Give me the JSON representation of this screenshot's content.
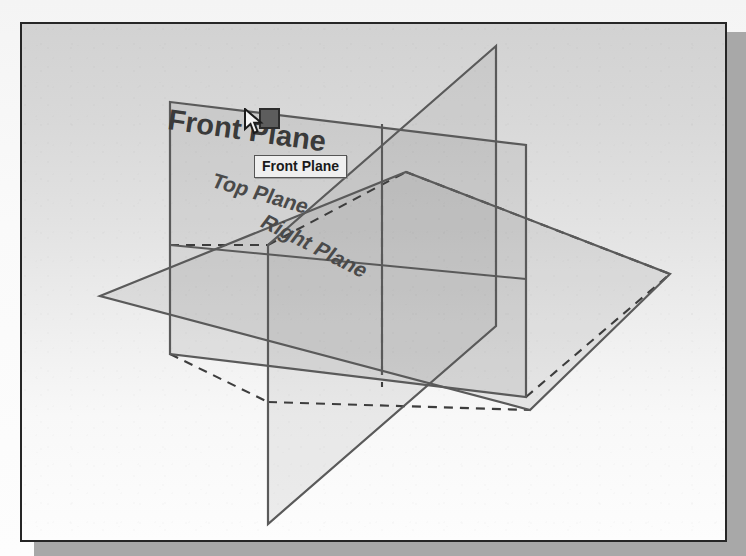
{
  "viewport": {
    "name": "cad-graphics-area",
    "background_top_color": "#d2d2d2",
    "background_bottom_color": "#fdfdfd",
    "border_color": "#262626",
    "shadow_color": "#a8a8a8"
  },
  "labels": {
    "front_plane": "Front Plane",
    "top_plane": "Top Plane",
    "right_plane": "Right Plane"
  },
  "tooltip": {
    "text": "Front Plane",
    "background_color": "#efefef",
    "border_color": "#555555"
  },
  "selection": {
    "handle_name": "selection-handle",
    "fill_color": "#5d5d5d",
    "border_color": "#2d2d2d"
  },
  "cursor": {
    "type": "arrow-pointer",
    "fill_color": "#f2f2f2",
    "outline_color": "#1c1c1c"
  },
  "geometry": {
    "plane_line_color": "#5a5a5a",
    "plane_fill_color": "rgba(150,150,150,0.16)",
    "hidden_line_style": "dashed",
    "planes": [
      {
        "name": "front-plane",
        "orientation": "vertical-front",
        "points": "168,100 524,143 524,395 168,352",
        "highlighted": true
      },
      {
        "name": "top-plane",
        "orientation": "horizontal",
        "points": "98,294 404,170 668,272 528,408"
      },
      {
        "name": "right-plane",
        "orientation": "vertical-side",
        "points": "494,44 266,243 266,522 494,324"
      }
    ]
  }
}
